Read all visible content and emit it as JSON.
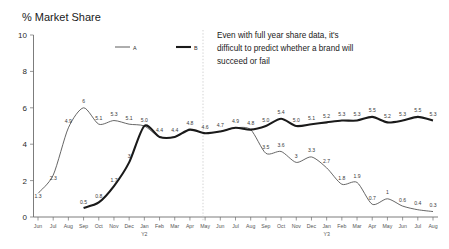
{
  "chart_data": {
    "type": "line",
    "title": "% Market Share",
    "xlabel": "",
    "ylabel": "",
    "ylim": [
      0,
      10
    ],
    "yticks": [
      "0",
      "2",
      "4",
      "6",
      "8",
      "10"
    ],
    "grid": false,
    "legend_position": "top-center",
    "categories": [
      "Jun",
      "Jul",
      "Aug",
      "Sep",
      "Oct",
      "Nov",
      "Dec",
      "Jan",
      "Feb",
      "Mar",
      "Apr",
      "May",
      "Jun",
      "Jul",
      "Aug",
      "Sep",
      "Oct",
      "Nov",
      "Dec",
      "Jan",
      "Feb",
      "Mar",
      "Apr",
      "May",
      "Jun",
      "Jul",
      "Aug"
    ],
    "year_markers": [
      {
        "index": 7,
        "label": "Y2"
      },
      {
        "index": 19,
        "label": "Y3"
      }
    ],
    "series": [
      {
        "name": "A",
        "style": "thin",
        "color": "#4a4a4a",
        "values": [
          1.3,
          2.3,
          4.9,
          6.0,
          5.1,
          5.3,
          5.1,
          5.0,
          4.4,
          4.4,
          4.8,
          4.6,
          4.7,
          4.9,
          4.8,
          3.5,
          3.6,
          3.0,
          3.3,
          2.7,
          1.8,
          1.9,
          0.7,
          1.0,
          0.6,
          0.4,
          0.3
        ],
        "labels": [
          "1.3",
          "2.3",
          "4.9",
          "6",
          "5.1",
          "5.3",
          "5.1",
          "5.0",
          "4.4",
          "4.4",
          "4.8",
          "4.6",
          "4.7",
          "4.9",
          "4.8",
          "3.5",
          "3.6",
          "3",
          "3.3",
          "2.7",
          "1.8",
          "1.9",
          "0.7",
          "1",
          "0.6",
          "0.4",
          "0.3"
        ]
      },
      {
        "name": "B",
        "style": "thick",
        "color": "#1a1a1a",
        "values": [
          null,
          null,
          null,
          0.5,
          0.8,
          1.7,
          3.0,
          5.0,
          4.4,
          4.4,
          4.8,
          4.6,
          4.7,
          4.9,
          4.8,
          5.0,
          5.4,
          5.0,
          5.1,
          5.2,
          5.3,
          5.3,
          5.5,
          5.2,
          5.3,
          5.5,
          5.3
        ],
        "labels": [
          null,
          null,
          null,
          "0.5",
          "0.8",
          "1.7",
          "3",
          null,
          null,
          null,
          null,
          null,
          null,
          null,
          null,
          "5.0",
          "5.4",
          "5.0",
          "5.1",
          "5.2",
          "5.3",
          "5.3",
          "5.5",
          "5.2",
          "5.3",
          "5.5",
          "5.3"
        ]
      }
    ],
    "annotation": {
      "lines": [
        "Even with full year share data, it's",
        "difficult to predict whether a brand will",
        "succeed or fail"
      ]
    },
    "divider": {
      "at_category": "May",
      "at_index": 11.5
    },
    "legend": [
      {
        "name": "A",
        "style": "thin"
      },
      {
        "name": "B",
        "style": "thick"
      }
    ]
  }
}
